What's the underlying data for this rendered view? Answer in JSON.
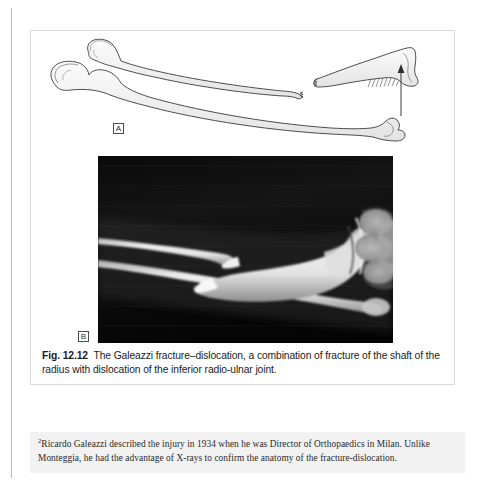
{
  "page": {
    "background_color": "#ffffff",
    "gutter_rule_color": "#b9b9b9"
  },
  "figure": {
    "box_border_color": "#d9d9d9",
    "panels": [
      {
        "id": "A",
        "label": "A",
        "type": "line-drawing",
        "description": "Line drawing of forearm bones: intact ulna below, radius above fractured mid-shaft with the distal radial fragment displaced and shortened, hatching at the inferior radio-ulnar joint and an upward arrow indicating proximal migration."
      },
      {
        "id": "B",
        "label": "B",
        "type": "radiograph",
        "description": "Antero-posterior radiograph of the forearm and wrist showing a transverse fracture of the radial shaft with dislocation of the inferior radio-ulnar joint."
      }
    ],
    "caption": {
      "number": "Fig. 12.12",
      "text": "The Galeazzi fracture–dislocation, a combination of fracture of the shaft of the radius with dislocation of the inferior radio-ulnar joint."
    }
  },
  "footnote": {
    "marker": "2",
    "text": "Ricardo Galeazzi described the injury in 1934 when he was Director of Orthopaedics in Milan. Unlike Monteggia, he had the advantage of X-rays to confirm the anatomy of the fracture-dislocation.",
    "background_color": "#f2f2f2"
  }
}
